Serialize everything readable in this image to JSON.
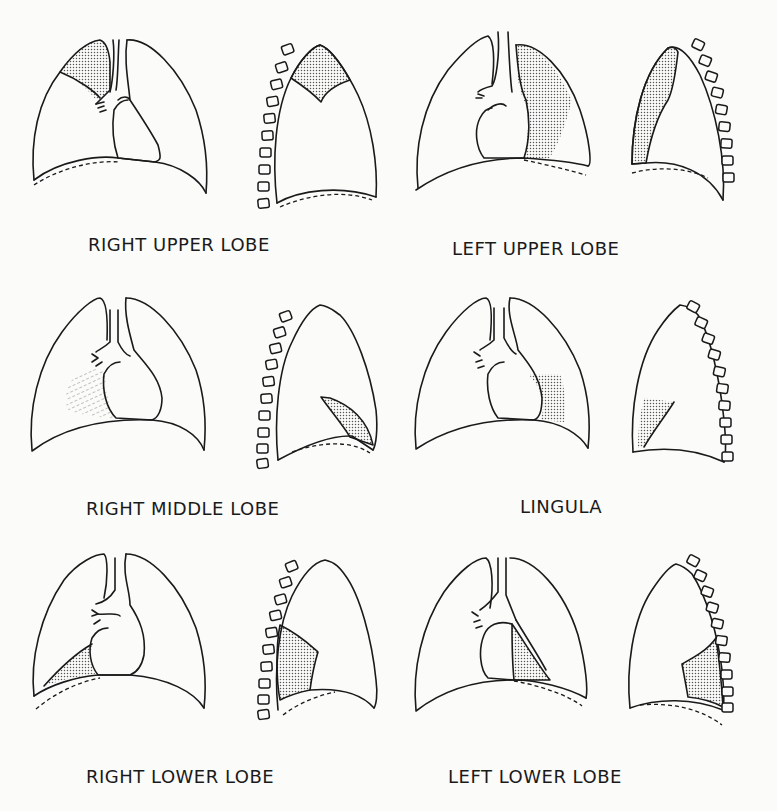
{
  "colors": {
    "line": "#1a1a1a",
    "background": "#fbfbfa",
    "shading": "#6a6a6a"
  },
  "panels": [
    {
      "id": "right-upper-lobe",
      "label": "RIGHT UPPER LOBE",
      "row": 1,
      "col": 1
    },
    {
      "id": "left-upper-lobe",
      "label": "LEFT UPPER LOBE",
      "row": 1,
      "col": 2
    },
    {
      "id": "right-middle-lobe",
      "label": "RIGHT MIDDLE LOBE",
      "row": 2,
      "col": 1
    },
    {
      "id": "lingula",
      "label": "LINGULA",
      "row": 2,
      "col": 2
    },
    {
      "id": "right-lower-lobe",
      "label": "RIGHT LOWER LOBE",
      "row": 3,
      "col": 1
    },
    {
      "id": "left-lower-lobe",
      "label": "LEFT LOWER LOBE",
      "row": 3,
      "col": 2
    }
  ],
  "views": [
    "frontal",
    "lateral"
  ]
}
